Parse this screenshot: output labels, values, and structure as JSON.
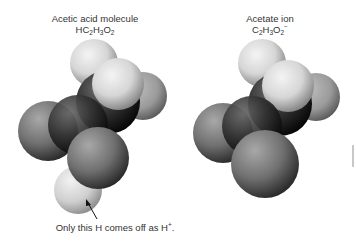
{
  "figure": {
    "left_panel": {
      "title": "Acetic acid molecule",
      "formula": {
        "parts": [
          {
            "t": "HC"
          },
          {
            "sub": "2"
          },
          {
            "t": "H"
          },
          {
            "sub": "3"
          },
          {
            "t": "O"
          },
          {
            "sub": "2"
          }
        ]
      },
      "formula_text": "HC2H3O2",
      "annotation": {
        "text": "Only this H comes off as H",
        "superscript": "+",
        "suffix": "."
      }
    },
    "right_panel": {
      "title": "Acetate ion",
      "formula": {
        "parts": [
          {
            "t": "C"
          },
          {
            "sub": "2"
          },
          {
            "t": "H"
          },
          {
            "sub": "3"
          },
          {
            "t": "O"
          },
          {
            "sub": "2"
          },
          {
            "sup": "−"
          }
        ]
      },
      "formula_text": "C2H3O2−"
    },
    "colors": {
      "hydrogen_light": "#e6e6e6",
      "hydrogen_shade": "#8a8a8a",
      "oxygen_light": "#9a9a9a",
      "oxygen_shade": "#2e2e2e",
      "carbon_light": "#5a5a5a",
      "carbon_shade": "#0a0a0a",
      "text": "#333333"
    }
  }
}
